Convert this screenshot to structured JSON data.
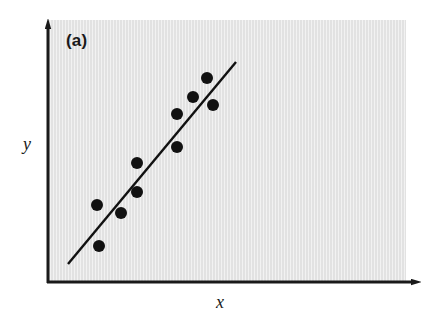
{
  "figure": {
    "panel_letter": "(a)",
    "width": 432,
    "height": 322,
    "background_color": "#ffffff",
    "panel_color": "#e2e2e2",
    "ink_color": "#1a1a1a"
  },
  "axes": {
    "x_label": "x",
    "y_label": "y",
    "x_arrow": "right-arrow",
    "y_arrow": "up-arrow"
  },
  "chart_data": {
    "type": "scatter",
    "title": "(a)",
    "xlabel": "x",
    "ylabel": "y",
    "grid": false,
    "legend": null,
    "xlim": [
      0,
      100
    ],
    "ylim": [
      0,
      100
    ],
    "axis_ticks": {
      "x": [],
      "y": []
    },
    "series": [
      {
        "name": "observations",
        "marker": "filled-circle",
        "color": "#111111",
        "marker_radius_px": 6,
        "points_px": [
          {
            "x": 99,
            "y": 246
          },
          {
            "x": 97,
            "y": 205
          },
          {
            "x": 121,
            "y": 213
          },
          {
            "x": 137,
            "y": 192
          },
          {
            "x": 137,
            "y": 163
          },
          {
            "x": 177,
            "y": 147
          },
          {
            "x": 177,
            "y": 114
          },
          {
            "x": 193,
            "y": 97
          },
          {
            "x": 213,
            "y": 105
          },
          {
            "x": 207,
            "y": 78
          }
        ],
        "x": [
          14.5,
          13.9,
          20.6,
          25.1,
          25.1,
          36.2,
          36.2,
          40.7,
          46.2,
          44.6
        ],
        "y": [
          14.1,
          29.7,
          26.6,
          34.6,
          45.6,
          51.7,
          64.3,
          70.7,
          67.7,
          78.0
        ]
      }
    ],
    "trend_line": {
      "name": "fitted-line",
      "color": "#111111",
      "width_px": 2.4,
      "start_px": {
        "x": 68,
        "y": 264
      },
      "end_px": {
        "x": 236,
        "y": 62
      },
      "start": {
        "x": 5.8,
        "y": 7.2
      },
      "end": {
        "x": 52.6,
        "y": 84.0
      }
    }
  }
}
